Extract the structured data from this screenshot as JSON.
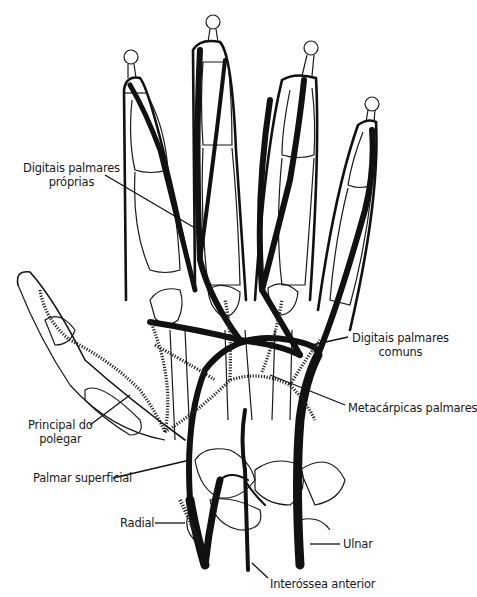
{
  "figure": {
    "labels": {
      "digitais_proprias": [
        "Digitais palmares",
        "próprias"
      ],
      "digitais_comuns": [
        "Digitais palmares",
        "comuns"
      ],
      "metacarpicas": "Metacárpicas palmares",
      "principal_polegar": [
        "Principal do",
        "polegar"
      ],
      "palmar_superficial": "Palmar superficial",
      "radial": "Radial",
      "ulnar": "Ulnar",
      "interossea": "Interóssea anterior"
    }
  }
}
